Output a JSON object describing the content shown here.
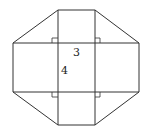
{
  "diagram": {
    "labels": {
      "width": "3",
      "height": "4"
    },
    "colors": {
      "stroke": "#333333",
      "background": "#ffffff"
    }
  }
}
